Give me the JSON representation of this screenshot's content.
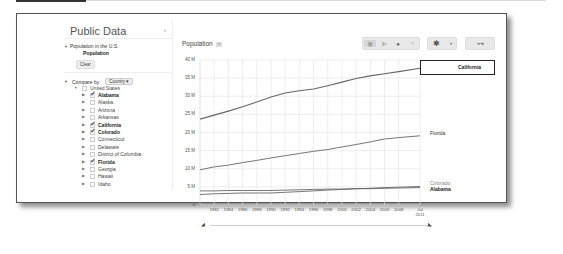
{
  "sidebar": {
    "title": "Public Data",
    "collapse_icon": "‹",
    "dataset": {
      "name": "Population in the U.S.",
      "metric": "Population",
      "clear_label": "Clear"
    },
    "compare_by": {
      "label": "Compare by",
      "dimension": "Country",
      "dropdown_icon": "▾"
    },
    "tree": {
      "root": {
        "label": "United States",
        "checked": false
      },
      "items": [
        {
          "label": "Alabama",
          "checked": true
        },
        {
          "label": "Alaska",
          "checked": false
        },
        {
          "label": "Arizona",
          "checked": false
        },
        {
          "label": "Arkansas",
          "checked": false
        },
        {
          "label": "California",
          "checked": true
        },
        {
          "label": "Colorado",
          "checked": true
        },
        {
          "label": "Connecticut",
          "checked": false
        },
        {
          "label": "Delaware",
          "checked": false
        },
        {
          "label": "District of Columbia",
          "checked": false
        },
        {
          "label": "Florida",
          "checked": true
        },
        {
          "label": "Georgia",
          "checked": false
        },
        {
          "label": "Hawaii",
          "checked": false
        },
        {
          "label": "Idaho",
          "checked": false
        }
      ]
    }
  },
  "chart_header": {
    "title": "Population",
    "help": "?"
  },
  "toolbar": {
    "chart_types": [
      {
        "name": "line-chart",
        "glyph": "⊵",
        "active": true
      },
      {
        "name": "bar-chart",
        "glyph": "⊫",
        "active": false
      },
      {
        "name": "map",
        "glyph": "●",
        "active": false
      },
      {
        "name": "bubble-chart",
        "glyph": "⁘",
        "active": false
      }
    ],
    "settings_glyph": "✱",
    "settings_caret": "▾",
    "link_glyph": "⊶"
  },
  "chart_data": {
    "type": "line",
    "title": "Population",
    "xlabel": "",
    "ylabel": "",
    "ylim": [
      0,
      40000000
    ],
    "y_ticks": [
      "0",
      "5 M",
      "10 M",
      "15 M",
      "20 M",
      "25 M",
      "30 M",
      "35 M",
      "40 M"
    ],
    "x_ticks": [
      "1982",
      "1984",
      "1986",
      "1988",
      "1990",
      "1992",
      "1994",
      "1996",
      "1998",
      "2000",
      "2002",
      "2004",
      "2006",
      "2008",
      "Jul 2011"
    ],
    "grid": true,
    "legend_position": "inline-right",
    "x": [
      1980,
      1982,
      1984,
      1986,
      1988,
      1990,
      1992,
      1994,
      1996,
      1998,
      2000,
      2002,
      2004,
      2006,
      2008,
      2011
    ],
    "series": [
      {
        "name": "California",
        "highlighted": true,
        "values": [
          23.7,
          24.8,
          25.9,
          27.1,
          28.4,
          29.8,
          30.9,
          31.5,
          32.0,
          32.9,
          33.9,
          34.9,
          35.6,
          36.2,
          36.8,
          37.7
        ]
      },
      {
        "name": "Florida",
        "values": [
          9.7,
          10.5,
          11.0,
          11.7,
          12.3,
          13.0,
          13.6,
          14.2,
          14.8,
          15.3,
          16.0,
          16.7,
          17.4,
          18.2,
          18.6,
          19.1
        ]
      },
      {
        "name": "Colorado",
        "values": [
          2.9,
          3.1,
          3.2,
          3.3,
          3.3,
          3.3,
          3.5,
          3.7,
          3.9,
          4.1,
          4.3,
          4.5,
          4.6,
          4.8,
          4.9,
          5.1
        ]
      },
      {
        "name": "Alabama",
        "values": [
          3.9,
          3.9,
          4.0,
          4.0,
          4.0,
          4.0,
          4.1,
          4.2,
          4.3,
          4.4,
          4.4,
          4.5,
          4.5,
          4.6,
          4.7,
          4.8
        ]
      }
    ]
  },
  "series_labels": {
    "california": "California",
    "florida": "Florida",
    "colorado": "Colorado",
    "alabama": "Alabama"
  },
  "timeline": {
    "start_glyph": "◢",
    "end_glyph": "◣"
  }
}
